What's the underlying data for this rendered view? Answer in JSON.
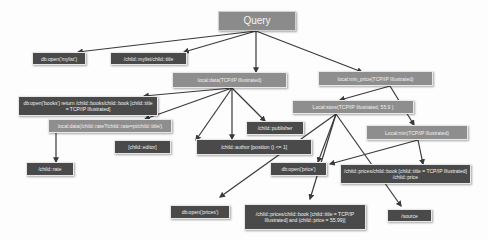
{
  "diagram": {
    "title": "Query",
    "colors": {
      "dark_node": "#4a4a4a",
      "gray_node": "#8e8e8e",
      "edge": "#3a3a3a",
      "background": "#fdfdfd"
    },
    "nodes": {
      "query": "Query",
      "db_open_mylist": "db:open('mylist')",
      "child_mylist_title": "/child::mylist/child::title",
      "local_data": "local:data(TCP/IP Illustrated)",
      "local_min_price": "local:min_price(TCP/IP Illustrated)",
      "db_open_books": "db:open('books') return /child::books/child::book [child::title = TCP/IP Illustrated]",
      "local_data_path": "local:data(/child::rate?/child::rate=pt/child::title/)",
      "child_editor": "[child::editor]",
      "child_publisher": "/child::publisher",
      "child_author": "/child::author [position () <= 1]",
      "local_store": "Local:store(TCP/IP Illustrated, 55.9 )",
      "child_rate": "/child::rate",
      "local_min": "Local:min(TCP/IP Illustrated)",
      "db_open_price": "db:open('price')",
      "child_prices_book": "/child::prices/child::book [child::title = TCP/IP Illustrated] /child::price",
      "db_open_prices": "db:open('prices')",
      "child_prices_book_and": "/child::prices/child::book [child::title = TCP/IP Illustrated] and (child::price = 55.99)]",
      "source": "/source"
    }
  }
}
